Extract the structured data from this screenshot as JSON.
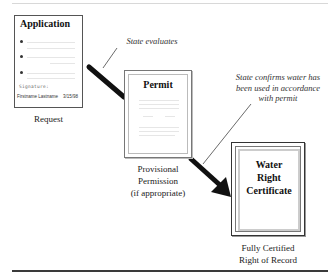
{
  "diagram": {
    "stages": [
      {
        "id": "application",
        "document_title": "Application",
        "signature_label": "Signature:",
        "signature_name": "Firstname Lastname",
        "signature_date": "3/15/98",
        "caption": "Request"
      },
      {
        "id": "permit",
        "document_title": "Permit",
        "caption_lines": [
          "Provisional",
          "Permission",
          "(if appropriate)"
        ]
      },
      {
        "id": "certificate",
        "document_title_lines": [
          "Water",
          "Right",
          "Certificate"
        ],
        "caption_lines": [
          "Fully Certified",
          "Right of Record"
        ]
      }
    ],
    "transitions": [
      {
        "from": "application",
        "to": "permit",
        "annotation": "State evaluates"
      },
      {
        "from": "permit",
        "to": "certificate",
        "annotation_lines": [
          "State confirms water has",
          "been used in accordance",
          "with permit"
        ]
      }
    ],
    "colors": {
      "arrow": "#111111",
      "border": "#555555",
      "text": "#222222",
      "rule": "#3a3a3a"
    }
  }
}
